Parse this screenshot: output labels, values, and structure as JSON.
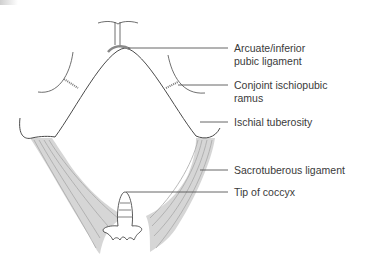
{
  "figure": {
    "labels": [
      {
        "id": "arcuate",
        "line1": "Arcuate/inferior",
        "line2": "pubic ligament"
      },
      {
        "id": "conjoint",
        "line1": "Conjoint ischiopubic",
        "line2": "ramus"
      },
      {
        "id": "ischial",
        "line1": "Ischial tuberosity"
      },
      {
        "id": "sacrotuberous",
        "line1": "Sacrotuberous ligament"
      },
      {
        "id": "coccyx",
        "line1": "Tip of coccyx"
      }
    ]
  },
  "colors": {
    "outline": "#4a4a4a",
    "ligament_fill": "#d6d6d6",
    "ligament_stripes": "#a8a8a8",
    "leader": "#555555",
    "text": "#3a3a3a"
  }
}
